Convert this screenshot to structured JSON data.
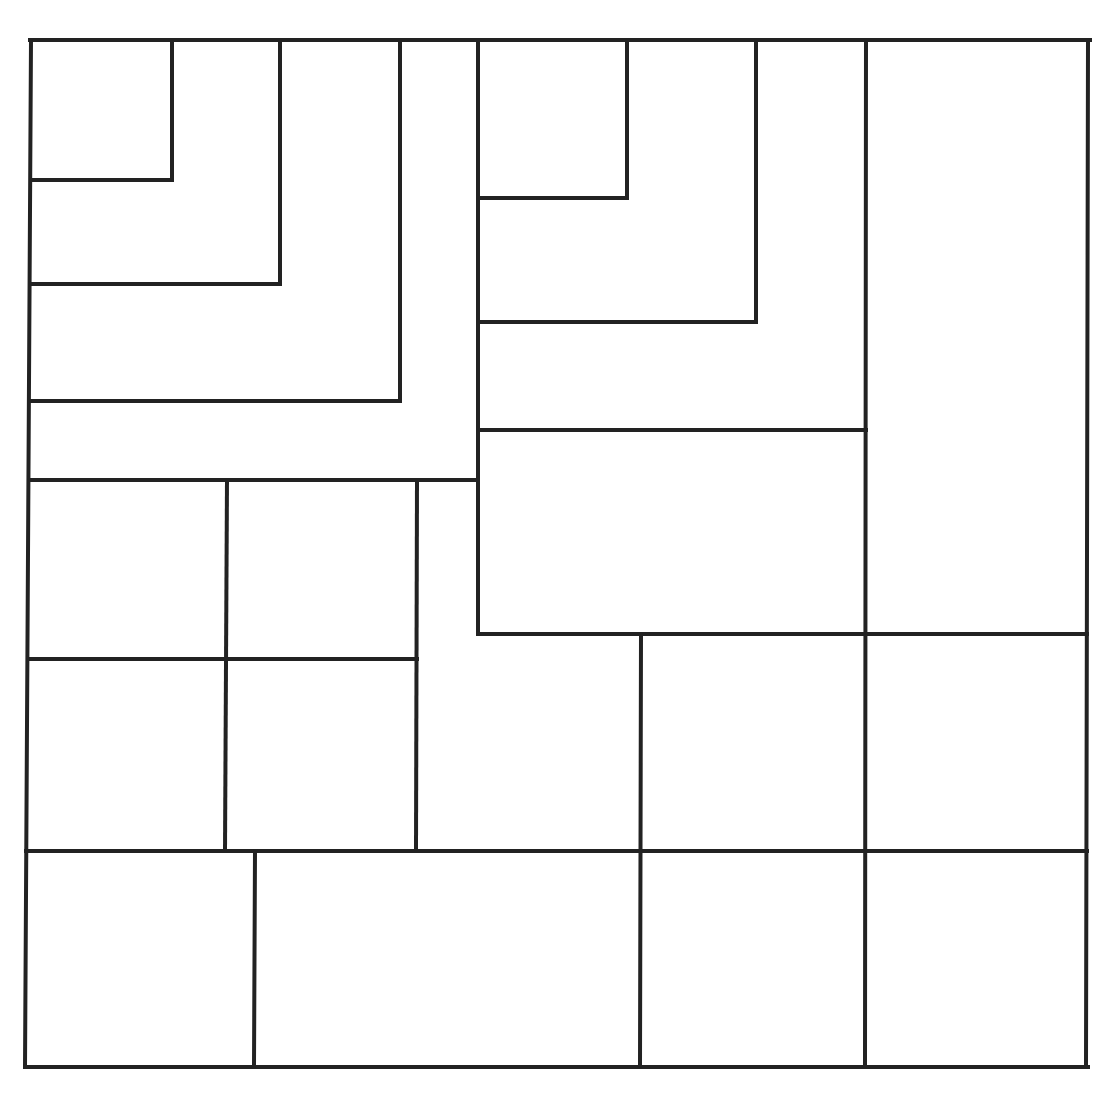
{
  "diagram": {
    "type": "rectangle-subdivision",
    "width": 1111,
    "height": 1096,
    "background": "#ffffff",
    "line_color": "#222222",
    "line_width": 4,
    "segments": [
      {
        "id": "outer-top",
        "points": [
          [
            30,
            40
          ],
          [
            1090,
            40
          ]
        ]
      },
      {
        "id": "outer-right",
        "points": [
          [
            1088,
            40
          ],
          [
            1086,
            1067
          ]
        ]
      },
      {
        "id": "outer-bottom",
        "points": [
          [
            25,
            1067
          ],
          [
            1088,
            1067
          ]
        ]
      },
      {
        "id": "outer-left",
        "points": [
          [
            31,
            40
          ],
          [
            25,
            1067
          ]
        ]
      },
      {
        "id": "tl-square-1",
        "points": [
          [
            32,
            180
          ],
          [
            172,
            180
          ],
          [
            172,
            40
          ]
        ]
      },
      {
        "id": "tl-square-2",
        "points": [
          [
            32,
            284
          ],
          [
            280,
            284
          ],
          [
            280,
            40
          ]
        ]
      },
      {
        "id": "tl-square-3",
        "points": [
          [
            30,
            401
          ],
          [
            400,
            401
          ],
          [
            400,
            40
          ]
        ]
      },
      {
        "id": "tl-band-bottom",
        "points": [
          [
            29,
            480
          ],
          [
            477,
            480
          ]
        ]
      },
      {
        "id": "mid-vertical",
        "points": [
          [
            478,
            40
          ],
          [
            478,
            634
          ]
        ]
      },
      {
        "id": "tm-square-1",
        "points": [
          [
            482,
            198
          ],
          [
            627,
            198
          ],
          [
            627,
            40
          ]
        ]
      },
      {
        "id": "tm-square-2",
        "points": [
          [
            482,
            322
          ],
          [
            756,
            322
          ],
          [
            756,
            40
          ]
        ]
      },
      {
        "id": "tm-bottom",
        "points": [
          [
            478,
            430
          ],
          [
            866,
            430
          ]
        ]
      },
      {
        "id": "right-col-vertical",
        "points": [
          [
            866,
            40
          ],
          [
            865,
            1066
          ]
        ]
      },
      {
        "id": "mid-horizontal",
        "points": [
          [
            478,
            634
          ],
          [
            1087,
            634
          ]
        ]
      },
      {
        "id": "mid-lower-vertical",
        "points": [
          [
            641,
            634
          ],
          [
            640,
            1066
          ]
        ]
      },
      {
        "id": "left-grid-v1",
        "points": [
          [
            227,
            480
          ],
          [
            225,
            850
          ]
        ]
      },
      {
        "id": "left-grid-v2",
        "points": [
          [
            417,
            480
          ],
          [
            416,
            850
          ]
        ]
      },
      {
        "id": "left-grid-h",
        "points": [
          [
            28,
            659
          ],
          [
            417,
            659
          ]
        ]
      },
      {
        "id": "low-horizontal",
        "points": [
          [
            26,
            851
          ],
          [
            1087,
            851
          ]
        ]
      },
      {
        "id": "low-left-vertical",
        "points": [
          [
            255,
            851
          ],
          [
            254,
            1066
          ]
        ]
      }
    ]
  }
}
